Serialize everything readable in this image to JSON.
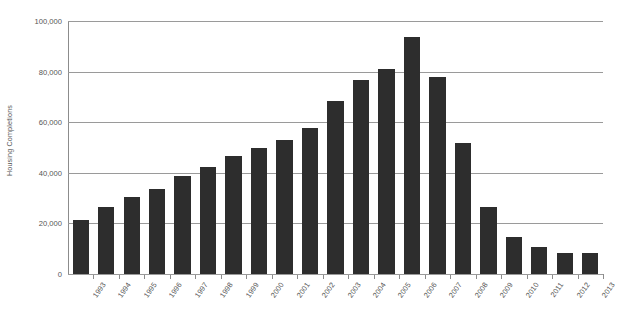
{
  "chart_data": {
    "type": "bar",
    "title": "",
    "xlabel": "",
    "ylabel": "Housing Completions",
    "ylim": [
      0,
      100000
    ],
    "grid": true,
    "legend": false,
    "bar_color": "#2d2d2d",
    "axis_color": "#8c8c8c",
    "gridline_color": "#9a9a9a",
    "text_color": "#555555",
    "y_ticks": [
      0,
      20000,
      40000,
      60000,
      80000,
      100000
    ],
    "y_tick_labels": [
      "0",
      "20,000",
      "40,000",
      "60,000",
      "80,000",
      "100,000"
    ],
    "categories": [
      "1993",
      "1994",
      "1995",
      "1996",
      "1997",
      "1998",
      "1999",
      "2000",
      "2001",
      "2002",
      "2003",
      "2004",
      "2005",
      "2006",
      "2007",
      "2008",
      "2009",
      "2010",
      "2011",
      "2012",
      "2013"
    ],
    "values": [
      21400,
      26400,
      30600,
      33700,
      38600,
      42400,
      46500,
      49800,
      52800,
      57700,
      68500,
      76800,
      81000,
      93800,
      78000,
      51900,
      26400,
      14600,
      10500,
      8500,
      8300
    ]
  }
}
